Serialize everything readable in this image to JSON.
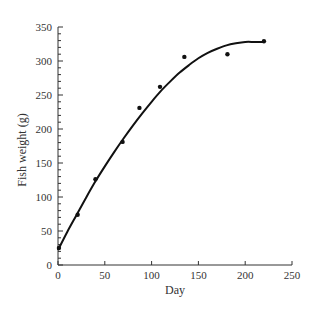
{
  "chart_data": {
    "type": "scatter",
    "title": "",
    "xlabel": "Day",
    "ylabel": "Fish weight (g)",
    "xlim": [
      0,
      250
    ],
    "ylim": [
      0,
      350
    ],
    "x_ticks": [
      0,
      50,
      100,
      150,
      200,
      250
    ],
    "y_ticks": [
      0,
      50,
      100,
      150,
      200,
      250,
      300,
      350
    ],
    "y_minor_step": 10,
    "grid": false,
    "legend": null,
    "series": [
      {
        "name": "Observed",
        "kind": "scatter",
        "x": [
          1,
          21,
          40,
          69,
          87,
          109,
          135,
          181,
          220
        ],
        "y": [
          25,
          74,
          126,
          181,
          231,
          262,
          306,
          310,
          329
        ]
      },
      {
        "name": "Fitted curve",
        "kind": "line",
        "x": [
          0,
          10,
          20,
          30,
          40,
          50,
          60,
          70,
          80,
          90,
          100,
          110,
          120,
          130,
          140,
          150,
          160,
          170,
          180,
          190,
          200,
          210,
          220
        ],
        "y": [
          22,
          49,
          74,
          99,
          123,
          145,
          166,
          186,
          205,
          223,
          240,
          256,
          270,
          283,
          294,
          304,
          312,
          318,
          323,
          326,
          328,
          328,
          328
        ]
      }
    ]
  },
  "colors": {
    "axis": "#333333",
    "line": "#111111",
    "marker": "#111111",
    "background": "#ffffff"
  }
}
